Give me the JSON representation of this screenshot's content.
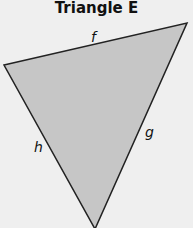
{
  "title": "Triangle E",
  "triangle": {
    "fill": "#c6c6c6",
    "stroke": "#222222",
    "vertices": [
      [
        4,
        65
      ],
      [
        187,
        23
      ],
      [
        95,
        229
      ]
    ],
    "sides": {
      "top": "f",
      "right": "g",
      "left": "h"
    }
  }
}
